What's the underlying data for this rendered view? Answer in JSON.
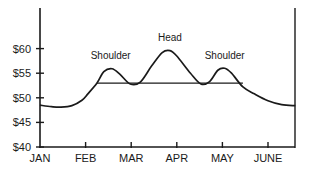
{
  "chart_data": {
    "type": "line",
    "title": "",
    "xlabel": "",
    "ylabel": "",
    "x_ticks": [
      "JAN",
      "FEB",
      "MAR",
      "APR",
      "MAY",
      "JUNE"
    ],
    "y_ticks": [
      "$40",
      "$45",
      "$50",
      "$55",
      "$60"
    ],
    "y_tick_values": [
      40,
      45,
      50,
      55,
      60
    ],
    "ylim": [
      40,
      68
    ],
    "xlim": [
      0,
      5.6
    ],
    "grid": false,
    "legend": null,
    "series": [
      {
        "name": "Price",
        "x": [
          0,
          0.25,
          0.45,
          0.7,
          0.92,
          1.05,
          1.25,
          1.4,
          1.58,
          1.75,
          1.98,
          2.2,
          2.45,
          2.68,
          2.85,
          3.0,
          3.3,
          3.53,
          3.72,
          3.9,
          4.05,
          4.2,
          4.45,
          4.7,
          5.0,
          5.3,
          5.6
        ],
        "y": [
          48.5,
          48.2,
          48.1,
          48.4,
          49.5,
          50.8,
          53.0,
          55.3,
          55.9,
          54.8,
          52.8,
          53.2,
          56.5,
          59.2,
          59.6,
          58.5,
          55.0,
          52.8,
          53.3,
          55.6,
          56.0,
          55.0,
          52.2,
          50.8,
          49.4,
          48.6,
          48.4
        ]
      }
    ],
    "neckline": {
      "x": [
        1.25,
        4.45
      ],
      "y": [
        53.0,
        53.0
      ]
    },
    "annotations": [
      {
        "text": "Shoulder",
        "x": 1.55,
        "y": 57.8
      },
      {
        "text": "Head",
        "x": 2.85,
        "y": 61.6
      },
      {
        "text": "Shoulder",
        "x": 4.05,
        "y": 57.8
      }
    ]
  }
}
